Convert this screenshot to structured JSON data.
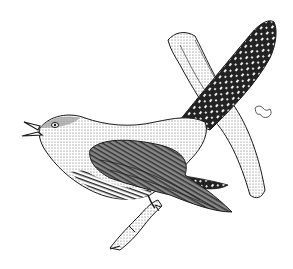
{
  "image": {
    "subject": "cuckoo bird perched on a branch",
    "style": "black ink line drawing",
    "background": "#ffffff",
    "ink": "#1a1a1a",
    "width": 293,
    "height": 269
  }
}
